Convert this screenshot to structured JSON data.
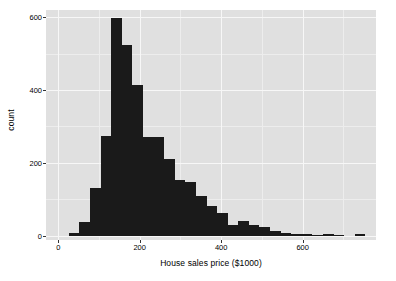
{
  "chart_data": {
    "type": "bar",
    "subtype": "histogram",
    "title": "",
    "subtitle": "",
    "xlabel": "House sales price ($1000)",
    "ylabel": "count",
    "xlim": [
      -30,
      780
    ],
    "ylim": [
      -12,
      620
    ],
    "grid": true,
    "grid_major_color": "#f7f7f7",
    "grid_minor_color": "#ededed",
    "panel_color": "#e0e0e0",
    "bar_color": "#1a1a1a",
    "legend": null,
    "legend_position": "none",
    "bin_width": 26,
    "x_ticks": [
      0,
      200,
      400,
      600
    ],
    "x_tick_labels": [
      "0",
      "200",
      "400",
      "600"
    ],
    "x_minor_ticks": [
      100,
      300,
      500,
      700
    ],
    "y_ticks": [
      0,
      200,
      400,
      600
    ],
    "y_tick_labels": [
      "0",
      "200",
      "400",
      "600"
    ],
    "y_minor_ticks": [
      100,
      300,
      500
    ],
    "bins": [
      {
        "x0": 0,
        "x1": 26,
        "count": 0
      },
      {
        "x0": 26,
        "x1": 52,
        "count": 8
      },
      {
        "x0": 52,
        "x1": 78,
        "count": 38
      },
      {
        "x0": 78,
        "x1": 104,
        "count": 130
      },
      {
        "x0": 104,
        "x1": 130,
        "count": 275
      },
      {
        "x0": 130,
        "x1": 156,
        "count": 597
      },
      {
        "x0": 156,
        "x1": 182,
        "count": 525
      },
      {
        "x0": 182,
        "x1": 208,
        "count": 415
      },
      {
        "x0": 208,
        "x1": 234,
        "count": 272
      },
      {
        "x0": 234,
        "x1": 260,
        "count": 270
      },
      {
        "x0": 260,
        "x1": 286,
        "count": 212
      },
      {
        "x0": 286,
        "x1": 312,
        "count": 152
      },
      {
        "x0": 312,
        "x1": 338,
        "count": 148
      },
      {
        "x0": 338,
        "x1": 364,
        "count": 110
      },
      {
        "x0": 364,
        "x1": 390,
        "count": 82
      },
      {
        "x0": 390,
        "x1": 416,
        "count": 62
      },
      {
        "x0": 416,
        "x1": 442,
        "count": 30
      },
      {
        "x0": 442,
        "x1": 468,
        "count": 40
      },
      {
        "x0": 468,
        "x1": 494,
        "count": 28
      },
      {
        "x0": 494,
        "x1": 520,
        "count": 25
      },
      {
        "x0": 520,
        "x1": 546,
        "count": 12
      },
      {
        "x0": 546,
        "x1": 572,
        "count": 7
      },
      {
        "x0": 572,
        "x1": 598,
        "count": 5
      },
      {
        "x0": 598,
        "x1": 624,
        "count": 4
      },
      {
        "x0": 624,
        "x1": 650,
        "count": 3
      },
      {
        "x0": 650,
        "x1": 676,
        "count": 5
      },
      {
        "x0": 676,
        "x1": 702,
        "count": 2
      },
      {
        "x0": 702,
        "x1": 728,
        "count": 0
      },
      {
        "x0": 728,
        "x1": 754,
        "count": 5
      },
      {
        "x0": 754,
        "x1": 780,
        "count": 0
      }
    ]
  }
}
